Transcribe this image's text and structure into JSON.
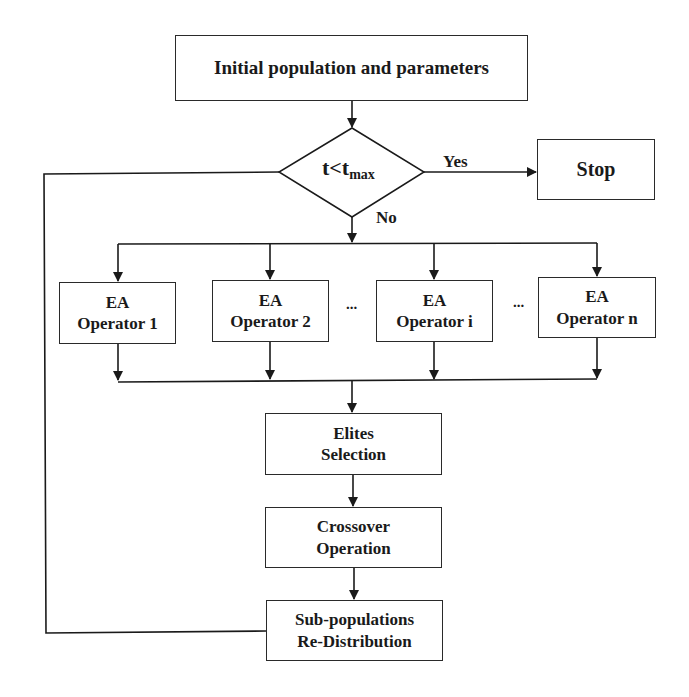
{
  "diagram": {
    "type": "flowchart",
    "nodes": {
      "init": {
        "label": "Initial population and parameters"
      },
      "decision": {
        "label_main": "t<t",
        "label_sub": "max"
      },
      "stop": {
        "label": "Stop"
      },
      "operators": [
        {
          "line1": "EA",
          "line2": "Operator 1"
        },
        {
          "line1": "EA",
          "line2": "Operator 2"
        },
        {
          "line1": "EA",
          "line2": "Operator i"
        },
        {
          "line1": "EA",
          "line2": "Operator n"
        }
      ],
      "ellipsis": [
        "...",
        "..."
      ],
      "elites": {
        "line1": "Elites",
        "line2": "Selection"
      },
      "crossover": {
        "line1": "Crossover",
        "line2": "Operation"
      },
      "redistribution": {
        "line1": "Sub-populations",
        "line2": "Re-Distribution"
      }
    },
    "edge_labels": {
      "yes": "Yes",
      "no": "No"
    },
    "edges": [
      {
        "from": "init",
        "to": "decision"
      },
      {
        "from": "decision",
        "to": "stop",
        "label": "Yes"
      },
      {
        "from": "decision",
        "to": "operators",
        "label": "No"
      },
      {
        "from": "operators",
        "to": "elites"
      },
      {
        "from": "elites",
        "to": "crossover"
      },
      {
        "from": "crossover",
        "to": "redistribution"
      },
      {
        "from": "redistribution",
        "to": "decision",
        "note": "feedback loop"
      }
    ]
  }
}
